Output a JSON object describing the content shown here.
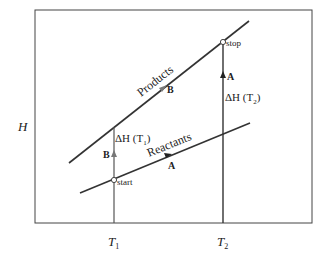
{
  "diagram": {
    "y_axis_label": "H",
    "x_ticks": [
      {
        "label": "T",
        "sub": "1"
      },
      {
        "label": "T",
        "sub": "2"
      }
    ],
    "lines": {
      "products": "Products",
      "reactants": "Reactants"
    },
    "points": {
      "start": "start",
      "stop": "stop"
    },
    "paths": {
      "a_marker": "A",
      "b_marker": "B"
    },
    "delta_h": {
      "t1": {
        "prefix": "ΔH (T",
        "sub": "1",
        "suffix": ")"
      },
      "t2": {
        "prefix": "ΔH (T",
        "sub": "2",
        "suffix": ")"
      }
    }
  }
}
